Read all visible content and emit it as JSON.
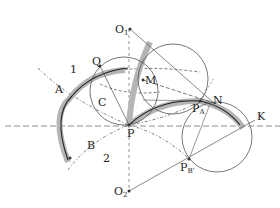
{
  "figure": {
    "type": "geometric construction diagram (conjugate cam/gear profiles)",
    "colors": {
      "line": "#555555",
      "band": "#b0b0b0",
      "curve": "#222222",
      "text": "#222222"
    }
  },
  "labels": {
    "O1": {
      "main": "O",
      "sub": "1"
    },
    "O2": {
      "main": "O",
      "sub": "2"
    },
    "P": {
      "main": "P"
    },
    "Q": {
      "main": "Q"
    },
    "M": {
      "main": "M"
    },
    "C": {
      "main": "C"
    },
    "A": {
      "main": "A"
    },
    "B": {
      "main": "B"
    },
    "N": {
      "main": "N"
    },
    "K": {
      "main": "K"
    },
    "PA": {
      "main": "P",
      "sub": "A"
    },
    "PB": {
      "main": "P",
      "sub": "B'"
    },
    "region1": {
      "main": "1"
    },
    "region2": {
      "main": "2"
    }
  },
  "points": {
    "O1": [
      130,
      29
    ],
    "O2": [
      129,
      191
    ],
    "P": [
      129,
      125
    ],
    "Q": [
      100,
      66
    ],
    "M": [
      143,
      80
    ],
    "PA": [
      200,
      101
    ],
    "N": [
      215,
      104
    ],
    "K": [
      255,
      120
    ],
    "PB": [
      189,
      159
    ]
  }
}
